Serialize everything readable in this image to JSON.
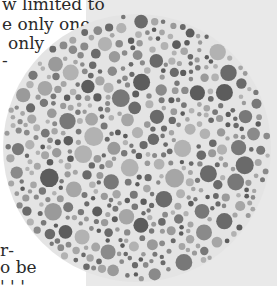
{
  "page": {
    "left_bg": "#ffffff",
    "panel_bg": "#e9e9e9",
    "text_color": "#2a2a2a",
    "text_lines_top": [
      {
        "text": "w limited to",
        "x": 2,
        "y": -6
      },
      {
        "text": "e only one",
        "x": 2,
        "y": 14
      },
      {
        "text": "only",
        "x": 8,
        "y": 33
      },
      {
        "text": "-",
        "x": 2,
        "y": 50
      }
    ],
    "text_lines_bottom": [
      {
        "text": "r-",
        "x": 0,
        "y": 240
      },
      {
        "text": "o be",
        "x": 0,
        "y": 257
      },
      {
        "text": "' ' '",
        "x": 0,
        "y": 276
      }
    ]
  },
  "plate": {
    "type": "color-vision-test-plate",
    "diameter": 270,
    "gap_color": "#e4e4e4",
    "dot_colors": [
      "#5c5c5c",
      "#6a6a6a",
      "#787878",
      "#8a8a8a",
      "#9a9a9a",
      "#a6a6a6",
      "#b2b2b2"
    ],
    "min_radius": 2.2,
    "max_radius": 9.5,
    "seed": 7
  }
}
